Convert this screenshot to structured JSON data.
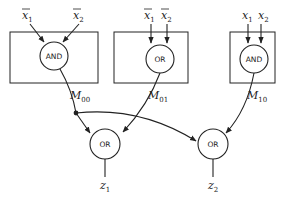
{
  "diagram": {
    "blocks": [
      {
        "id": "block-00",
        "gate": "AND",
        "inputs": [
          {
            "name": "x",
            "sub": "1",
            "negated": true
          },
          {
            "name": "x",
            "sub": "2",
            "negated": true
          }
        ],
        "output": {
          "name": "M",
          "sub": "00"
        }
      },
      {
        "id": "block-01",
        "gate": "OR",
        "inputs": [
          {
            "name": "x",
            "sub": "1",
            "negated": true
          },
          {
            "name": "x",
            "sub": "2",
            "negated": true
          }
        ],
        "output": {
          "name": "M",
          "sub": "01"
        }
      },
      {
        "id": "block-10",
        "gate": "AND",
        "inputs": [
          {
            "name": "x",
            "sub": "1",
            "negated": false
          },
          {
            "name": "x",
            "sub": "2",
            "negated": false
          }
        ],
        "output": {
          "name": "M",
          "sub": "10"
        }
      }
    ],
    "outputs": [
      {
        "id": "or-z1",
        "gate": "OR",
        "inputs_from": [
          "M00",
          "M01"
        ],
        "output": {
          "name": "z",
          "sub": "1"
        }
      },
      {
        "id": "or-z2",
        "gate": "OR",
        "inputs_from": [
          "M00",
          "M10"
        ],
        "output": {
          "name": "z",
          "sub": "2"
        }
      }
    ],
    "junction": {
      "signal": "M00",
      "fans_out_to": [
        "z1",
        "z2"
      ]
    }
  }
}
